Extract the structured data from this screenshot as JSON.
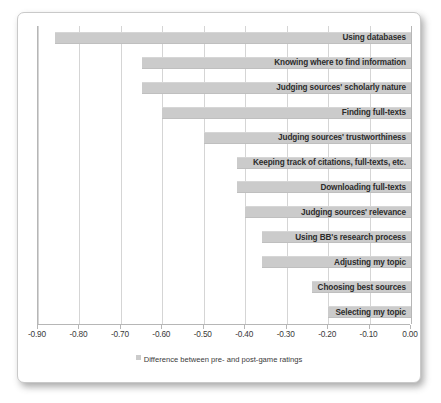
{
  "chart_data": {
    "type": "bar",
    "orientation": "horizontal",
    "title": "",
    "subtitle": "",
    "xlabel": "",
    "ylabel": "",
    "xlim": [
      -0.9,
      0.0
    ],
    "xticks": [
      "-0.90",
      "-0.80",
      "-0.70",
      "-0.60",
      "-0.50",
      "-0.40",
      "-0.30",
      "-0.20",
      "-0.10",
      "0.00"
    ],
    "xtick_values": [
      -0.9,
      -0.8,
      -0.7,
      -0.6,
      -0.5,
      -0.4,
      -0.3,
      -0.2,
      -0.1,
      0.0
    ],
    "grid": true,
    "grid_axis": "x",
    "legend": {
      "position": "bottom",
      "entries": [
        {
          "label": "Difference between pre- and post-game ratings",
          "color": "#cbcbcb"
        }
      ]
    },
    "series": [
      {
        "name": "Difference between pre- and post-game ratings",
        "color": "#cbcbcb",
        "values": [
          -0.86,
          -0.65,
          -0.65,
          -0.6,
          -0.5,
          -0.42,
          -0.42,
          -0.4,
          -0.36,
          -0.36,
          -0.24,
          -0.2
        ]
      }
    ],
    "categories": [
      "Using databases",
      "Knowing where to find information",
      "Judging sources' scholarly nature",
      "Finding full-texts",
      "Judging sources' trustworthiness",
      "Keeping track of citations, full-texts, etc.",
      "Downloading full-texts",
      "Judging sources' relevance",
      "Using BB's research process",
      "Adjusting my topic",
      "Choosing best sources",
      "Selecting my topic"
    ],
    "bars": [
      {
        "label": "Using databases",
        "value": -0.86
      },
      {
        "label": "Knowing where to find information",
        "value": -0.65
      },
      {
        "label": "Judging sources' scholarly nature",
        "value": -0.65
      },
      {
        "label": "Finding full-texts",
        "value": -0.6
      },
      {
        "label": "Judging sources' trustworthiness",
        "value": -0.5
      },
      {
        "label": "Keeping track of citations, full-texts, etc.",
        "value": -0.42
      },
      {
        "label": "Downloading full-texts",
        "value": -0.42
      },
      {
        "label": "Judging sources' relevance",
        "value": -0.4
      },
      {
        "label": "Using BB's research process",
        "value": -0.36
      },
      {
        "label": "Adjusting my topic",
        "value": -0.36
      },
      {
        "label": "Choosing best sources",
        "value": -0.24
      },
      {
        "label": "Selecting my topic",
        "value": -0.2
      }
    ]
  },
  "colors": {
    "bar": "#cbcbcb",
    "gridline": "#d5d5d5",
    "axis": "#b6b6b6",
    "text": "#2b2b2b",
    "card_border": "#c9c9c9",
    "background": "#ffffff"
  }
}
